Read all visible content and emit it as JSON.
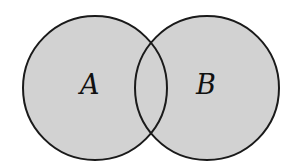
{
  "diagram": {
    "type": "venn",
    "sets": [
      {
        "label": "A",
        "cx": 95,
        "cy": 88,
        "r": 72
      },
      {
        "label": "B",
        "cx": 207,
        "cy": 88,
        "r": 72
      }
    ],
    "colors": {
      "fill": "#d2d2d2",
      "stroke": "#1a1a1a",
      "background": "#ffffff"
    }
  }
}
